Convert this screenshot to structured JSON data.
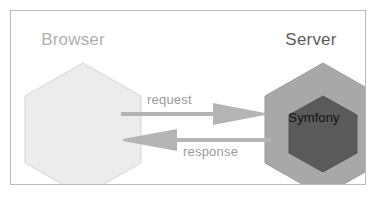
{
  "diagram": {
    "title": "",
    "nodes": [
      {
        "id": "browser",
        "label": "Browser",
        "label_color": "#b0b0b0",
        "shape": "hexagon",
        "fill": "#ececec",
        "stroke": "#d4d4d4"
      },
      {
        "id": "server",
        "label": "Server",
        "label_color": "#5d5d5d",
        "shape": "hexagon",
        "fill": "#a8a8a8",
        "stroke": "#9a9a9a",
        "inner": {
          "id": "symfony",
          "label": "Symfony",
          "label_color": "#121212",
          "shape": "hexagon",
          "fill": "#5a5a5a",
          "stroke": "#525252"
        }
      }
    ],
    "edges": [
      {
        "id": "request",
        "label": "request",
        "from": "browser",
        "to": "server",
        "direction": "right",
        "color": "#b4b4b4",
        "label_color": "#9b9b9b"
      },
      {
        "id": "response",
        "label": "response",
        "from": "server",
        "to": "browser",
        "direction": "left",
        "color": "#b4b4b4",
        "label_color": "#9b9b9b"
      }
    ],
    "frame": {
      "border_color": "#b9b9b9",
      "background": "#ffffff"
    }
  }
}
